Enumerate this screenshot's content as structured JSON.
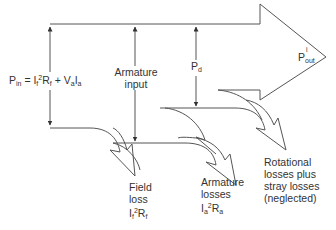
{
  "diagram": {
    "type": "power-flow",
    "labels": {
      "pin": {
        "P": "P",
        "in_sub": "in",
        "eq": " = I",
        "f_sub1": "f",
        "sq": "2",
        "R": "R",
        "f_sub2": "f",
        "plus": " + V",
        "a_sub1": "a",
        "I": "I",
        "a_sub2": "a"
      },
      "armature_input": [
        "Armature",
        "input"
      ],
      "pd": {
        "P": "P",
        "sub": "d"
      },
      "pout": {
        "P": "P",
        "sup": "i",
        "sub": "out"
      },
      "field_loss": {
        "line1": "Field",
        "line2": "loss",
        "I": "I",
        "f_sub1": "f",
        "sq": "2",
        "R": "R",
        "f_sub2": "f"
      },
      "armature_losses": {
        "line1": "Armature",
        "line2": "losses",
        "I": "I",
        "a_sub1": "a",
        "sq": "2",
        "R": "R",
        "a_sub2": "a"
      },
      "rotational": [
        "Rotational",
        "losses plus",
        "stray losses",
        "(neglected)"
      ]
    },
    "colors": {
      "stroke": "#444444",
      "text": "#333333",
      "background": "#ffffff"
    }
  }
}
